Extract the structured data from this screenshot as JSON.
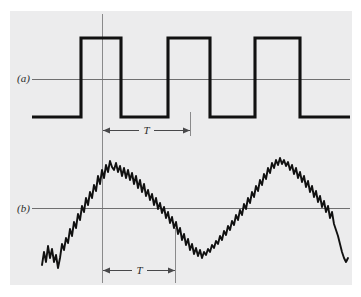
{
  "figure": {
    "background_color": "#ececed",
    "page_color": "#ffffff",
    "wave_color": "#111111",
    "axis_color": "#6f6f70",
    "guide_color": "#8a8a8b",
    "dim_color": "#48484a",
    "panels": [
      {
        "id": "a",
        "label": "(a)",
        "label_x": 17,
        "label_y": 82,
        "axis_y": 79,
        "axis_x1": 32,
        "axis_x2": 350,
        "period_label": "T",
        "period_label_x": 146,
        "period_label_y": 134,
        "dim_y": 130,
        "dim_x1": 103,
        "dim_x2": 190
      },
      {
        "id": "b",
        "label": "(b)",
        "label_x": 17,
        "label_y": 212,
        "axis_y": 208,
        "axis_x1": 32,
        "axis_x2": 350,
        "period_label": "T",
        "period_label_x": 139,
        "period_label_y": 274,
        "dim_y": 270,
        "dim_x1": 103,
        "dim_x2": 175
      }
    ],
    "guides": [
      {
        "name": "guide-left",
        "x": 102,
        "y1": 14,
        "y2": 283
      },
      {
        "name": "guide-right-top",
        "x": 190,
        "y1": 112,
        "y2": 136
      },
      {
        "name": "guide-right-bottom",
        "x": 175,
        "y1": 228,
        "y2": 283
      }
    ],
    "chart_data": {
      "type": "line",
      "title": "",
      "subtitle": "",
      "xlabel": "",
      "ylabel": "",
      "grid": false,
      "legend": null,
      "annotations": [
        "(a)",
        "(b)",
        "T",
        "T"
      ],
      "series": [
        {
          "name": "square-wave",
          "panel": "a",
          "description": "ideal periodic rectangular pulse train, period T",
          "high_level_y": 38,
          "low_level_y": 117,
          "baseline_y": 79,
          "period_px": 87,
          "points": [
            [
              32,
              117
            ],
            [
              81,
              117
            ],
            [
              81,
              38
            ],
            [
              121,
              38
            ],
            [
              121,
              117
            ],
            [
              168,
              117
            ],
            [
              168,
              38
            ],
            [
              210,
              38
            ],
            [
              210,
              117
            ],
            [
              255,
              117
            ],
            [
              255,
              38
            ],
            [
              300,
              38
            ],
            [
              300,
              117
            ],
            [
              350,
              117
            ]
          ]
        },
        {
          "name": "noisy-wave",
          "panel": "b",
          "description": "same periodic signal buried in random noise, period T",
          "baseline_y": 208,
          "period_px": 74,
          "points": [
            [
              42,
              265
            ],
            [
              44,
              252
            ],
            [
              46,
              262
            ],
            [
              48,
              246
            ],
            [
              50,
              258
            ],
            [
              52,
              249
            ],
            [
              54,
              262
            ],
            [
              56,
              255
            ],
            [
              58,
              268
            ],
            [
              60,
              258
            ],
            [
              62,
              244
            ],
            [
              64,
              250
            ],
            [
              66,
              238
            ],
            [
              68,
              243
            ],
            [
              70,
              229
            ],
            [
              72,
              236
            ],
            [
              74,
              222
            ],
            [
              76,
              228
            ],
            [
              78,
              214
            ],
            [
              80,
              220
            ],
            [
              82,
              206
            ],
            [
              84,
              212
            ],
            [
              86,
              198
            ],
            [
              88,
              205
            ],
            [
              90,
              192
            ],
            [
              92,
              198
            ],
            [
              94,
              185
            ],
            [
              96,
              191
            ],
            [
              98,
              176
            ],
            [
              100,
              184
            ],
            [
              102,
              170
            ],
            [
              104,
              178
            ],
            [
              106,
              165
            ],
            [
              108,
              172
            ],
            [
              110,
              161
            ],
            [
              112,
              167
            ],
            [
              114,
              170
            ],
            [
              116,
              163
            ],
            [
              118,
              172
            ],
            [
              120,
              166
            ],
            [
              122,
              176
            ],
            [
              124,
              168
            ],
            [
              126,
              178
            ],
            [
              128,
              170
            ],
            [
              130,
              180
            ],
            [
              132,
              173
            ],
            [
              134,
              184
            ],
            [
              136,
              176
            ],
            [
              138,
              188
            ],
            [
              140,
              180
            ],
            [
              142,
              192
            ],
            [
              144,
              184
            ],
            [
              146,
              196
            ],
            [
              148,
              190
            ],
            [
              150,
              200
            ],
            [
              152,
              194
            ],
            [
              154,
              205
            ],
            [
              156,
              198
            ],
            [
              158,
              209
            ],
            [
              160,
              203
            ],
            [
              162,
              213
            ],
            [
              164,
              207
            ],
            [
              166,
              218
            ],
            [
              168,
              212
            ],
            [
              170,
              223
            ],
            [
              172,
              217
            ],
            [
              174,
              228
            ],
            [
              176,
              222
            ],
            [
              178,
              234
            ],
            [
              180,
              228
            ],
            [
              182,
              240
            ],
            [
              184,
              234
            ],
            [
              186,
              245
            ],
            [
              188,
              239
            ],
            [
              190,
              250
            ],
            [
              192,
              244
            ],
            [
              194,
              254
            ],
            [
              196,
              248
            ],
            [
              198,
              256
            ],
            [
              200,
              250
            ],
            [
              202,
              258
            ],
            [
              204,
              252
            ],
            [
              206,
              255
            ],
            [
              208,
              249
            ],
            [
              210,
              252
            ],
            [
              212,
              245
            ],
            [
              214,
              248
            ],
            [
              216,
              241
            ],
            [
              218,
              244
            ],
            [
              220,
              236
            ],
            [
              222,
              240
            ],
            [
              224,
              231
            ],
            [
              226,
              235
            ],
            [
              228,
              226
            ],
            [
              230,
              230
            ],
            [
              232,
              221
            ],
            [
              234,
              225
            ],
            [
              236,
              215
            ],
            [
              238,
              220
            ],
            [
              240,
              210
            ],
            [
              242,
              215
            ],
            [
              244,
              204
            ],
            [
              246,
              209
            ],
            [
              248,
              198
            ],
            [
              250,
              203
            ],
            [
              252,
              192
            ],
            [
              254,
              197
            ],
            [
              256,
              186
            ],
            [
              258,
              191
            ],
            [
              260,
              180
            ],
            [
              262,
              185
            ],
            [
              264,
              174
            ],
            [
              266,
              179
            ],
            [
              268,
              168
            ],
            [
              270,
              173
            ],
            [
              272,
              163
            ],
            [
              274,
              168
            ],
            [
              276,
              160
            ],
            [
              278,
              165
            ],
            [
              280,
              158
            ],
            [
              282,
              164
            ],
            [
              284,
              160
            ],
            [
              286,
              166
            ],
            [
              288,
              162
            ],
            [
              290,
              170
            ],
            [
              292,
              165
            ],
            [
              294,
              174
            ],
            [
              296,
              168
            ],
            [
              298,
              178
            ],
            [
              300,
              172
            ],
            [
              302,
              182
            ],
            [
              304,
              176
            ],
            [
              306,
              187
            ],
            [
              308,
              181
            ],
            [
              310,
              192
            ],
            [
              312,
              186
            ],
            [
              314,
              197
            ],
            [
              316,
              191
            ],
            [
              318,
              202
            ],
            [
              320,
              196
            ],
            [
              322,
              207
            ],
            [
              324,
              201
            ],
            [
              326,
              212
            ],
            [
              328,
              206
            ],
            [
              330,
              218
            ],
            [
              332,
              212
            ],
            [
              334,
              224
            ],
            [
              336,
              230
            ],
            [
              338,
              236
            ],
            [
              340,
              244
            ],
            [
              342,
              252
            ],
            [
              344,
              258
            ],
            [
              346,
              262
            ],
            [
              348,
              258
            ]
          ]
        }
      ]
    }
  }
}
